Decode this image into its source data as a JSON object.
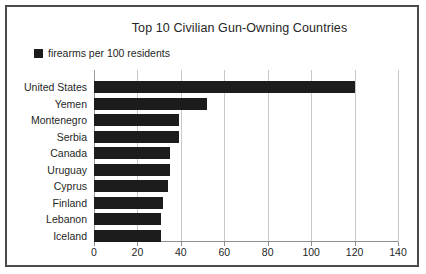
{
  "chart_data": {
    "type": "bar",
    "orientation": "horizontal",
    "title": "Top 10 Civilian Gun-Owning Countries",
    "xlabel": "",
    "ylabel": "",
    "categories": [
      "United States",
      "Yemen",
      "Montenegro",
      "Serbia",
      "Canada",
      "Uruguay",
      "Cyprus",
      "Finland",
      "Lebanon",
      "Iceland"
    ],
    "values": [
      120,
      52,
      39,
      39,
      35,
      35,
      34,
      32,
      31,
      31
    ],
    "series": [
      {
        "name": "firearms per 100 residents",
        "values": [
          120,
          52,
          39,
          39,
          35,
          35,
          34,
          32,
          31,
          31
        ],
        "color": "#1c1c1c"
      }
    ],
    "xlim": [
      0,
      140
    ],
    "xticks": [
      0,
      20,
      40,
      60,
      80,
      100,
      120,
      140
    ],
    "xtick_labels": [
      "0",
      "20",
      "40",
      "60",
      "80",
      "100",
      "120",
      "140"
    ],
    "grid": "vertical",
    "legend": {
      "position": "top-left",
      "entries": [
        {
          "label": "firearms per 100 residents",
          "color": "#1c1c1c"
        }
      ]
    }
  },
  "frame": {
    "border_color": "#4a4a4a",
    "background": "#ffffff"
  }
}
